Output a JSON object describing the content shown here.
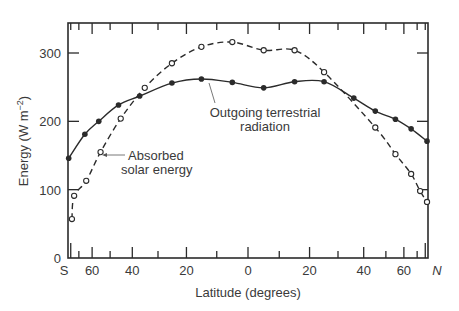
{
  "chart_data": {
    "type": "line",
    "title": "",
    "xlabel": "Latitude (degrees)",
    "ylabel": "Energy (W m−2)",
    "ylabel_main": "Energy (W m",
    "ylabel_sup": "−2",
    "ylabel_close": ")",
    "ylim": [
      0,
      340
    ],
    "xlim": [
      -90,
      90
    ],
    "x_scale": "sine-of-latitude",
    "grid": false,
    "legend": "inline annotations",
    "y_ticks": [
      0,
      100,
      200,
      300
    ],
    "y_tick_labels": [
      "0",
      "100",
      "200",
      "300"
    ],
    "x_ticks": [
      {
        "lat": -90,
        "label": "S"
      },
      {
        "lat": -70,
        "label": ""
      },
      {
        "lat": -60,
        "label": "60"
      },
      {
        "lat": -50,
        "label": ""
      },
      {
        "lat": -40,
        "label": "40"
      },
      {
        "lat": -30,
        "label": ""
      },
      {
        "lat": -20,
        "label": "20"
      },
      {
        "lat": -10,
        "label": ""
      },
      {
        "lat": 0,
        "label": "0"
      },
      {
        "lat": 10,
        "label": ""
      },
      {
        "lat": 20,
        "label": "20"
      },
      {
        "lat": 30,
        "label": ""
      },
      {
        "lat": 40,
        "label": "40"
      },
      {
        "lat": 50,
        "label": ""
      },
      {
        "lat": 60,
        "label": "60"
      },
      {
        "lat": 70,
        "label": ""
      },
      {
        "lat": 90,
        "label": "N"
      }
    ],
    "series": [
      {
        "name": "Outgoing terrestrial radiation",
        "style": "solid",
        "marker": "filled-circle",
        "lat": [
          -85,
          -65,
          -56,
          -46,
          -37,
          -25,
          -15,
          -5,
          5,
          15,
          25,
          36,
          45,
          55,
          65,
          84
        ],
        "values": [
          146,
          181,
          200,
          224,
          237,
          256,
          262,
          257,
          249,
          258,
          258,
          234,
          215,
          203,
          189,
          171
        ]
      },
      {
        "name": "Absorbed solar energy",
        "style": "dashed",
        "marker": "open-circle",
        "lat": [
          -78,
          -75,
          -64,
          -55,
          -45,
          -35,
          -25,
          -15,
          -5,
          5,
          15,
          25,
          45,
          55,
          65,
          73,
          84
        ],
        "values": [
          57,
          91,
          113,
          155,
          204,
          249,
          285,
          309,
          316,
          304,
          304,
          272,
          191,
          152,
          123,
          98,
          82
        ]
      }
    ],
    "annotations": [
      {
        "text_lines": [
          "Outgoing terrestrial",
          "radiation"
        ],
        "points_to": "Outgoing terrestrial radiation"
      },
      {
        "text_lines": [
          "Absorbed",
          "solar energy"
        ],
        "points_to": "Absorbed solar energy"
      }
    ]
  }
}
